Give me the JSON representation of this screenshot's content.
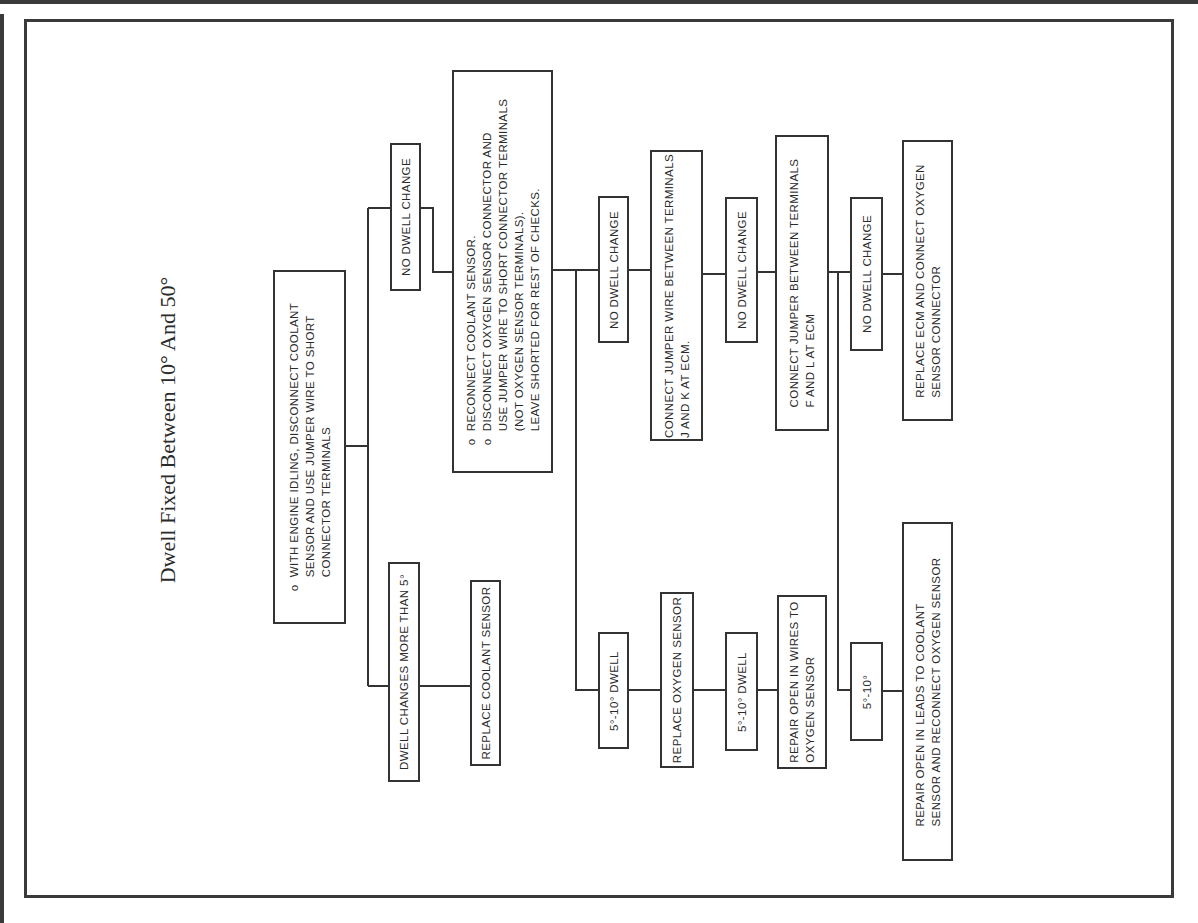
{
  "title": "Dwell Fixed Between 10° And 50°",
  "nodes": {
    "start": {
      "bullet": "o",
      "lines": [
        "WITH ENGINE IDLING, DISCONNECT COOLANT",
        "SENSOR AND USE JUMPER WIRE TO SHORT",
        "CONNECTOR TERMINALS"
      ]
    },
    "no_change_1": {
      "label": "NO DWELL CHANGE"
    },
    "changes_more_5": {
      "label": "DWELL CHANGES MORE THAN 5°"
    },
    "replace_coolant": {
      "label": "REPLACE COOLANT SENSOR"
    },
    "reconnect": {
      "bullet": "o",
      "lines": [
        "RECONNECT COOLANT SENSOR.",
        "DISCONNECT OXYGEN SENSOR CONNECTOR AND",
        "USE JUMPER WIRE TO SHORT CONNECTOR TERMINALS",
        "(NOT OXYGEN SENSOR TERMINALS).",
        "LEAVE SHORTED FOR REST OF CHECKS."
      ]
    },
    "no_change_2": {
      "label": "NO DWELL CHANGE"
    },
    "dwell_5_10_a": {
      "label": "5°-10° DWELL"
    },
    "jumper_jk": {
      "lines": [
        "CONNECT JUMPER WIRE BETWEEN TERMINALS",
        "J AND K AT ECM."
      ]
    },
    "replace_oxygen": {
      "label": "REPLACE OXYGEN SENSOR"
    },
    "no_change_3": {
      "label": "NO DWELL CHANGE"
    },
    "dwell_5_10_b": {
      "label": "5°-10° DWELL"
    },
    "repair_wires": {
      "lines": [
        "REPAIR OPEN IN WIRES TO",
        "OXYGEN SENSOR"
      ]
    },
    "jumper_fl": {
      "lines": [
        "CONNECT JUMPER BETWEEN TERMINALS",
        "F AND L AT ECM"
      ]
    },
    "no_change_4": {
      "label": "NO DWELL CHANGE"
    },
    "dwell_5_10_c": {
      "label": "5°-10°"
    },
    "replace_ecm": {
      "lines": [
        "REPLACE ECM AND CONNECT OXYGEN",
        "SENSOR CONNECTOR"
      ]
    },
    "repair_leads": {
      "lines": [
        "REPAIR OPEN IN LEADS TO COOLANT",
        "SENSOR AND RECONNECT OXYGEN SENSOR"
      ]
    }
  },
  "colors": {
    "line": "#333333",
    "background": "#ffffff",
    "text": "#2a2a2a"
  }
}
